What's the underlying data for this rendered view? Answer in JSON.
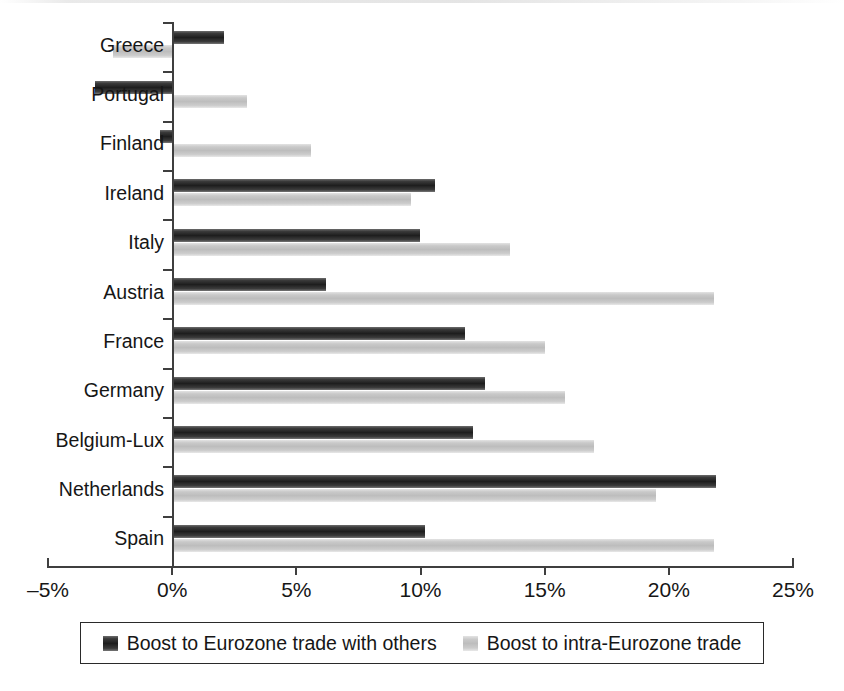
{
  "chart_data": {
    "type": "bar",
    "orientation": "horizontal",
    "title": "",
    "subtitle": "",
    "xlabel": "",
    "ylabel": "",
    "xlim": [
      -5,
      25
    ],
    "xtick_values": [
      -5,
      0,
      5,
      10,
      15,
      20,
      25
    ],
    "xtick_labels": [
      "–5%",
      "0%",
      "5%",
      "10%",
      "15%",
      "20%",
      "25%"
    ],
    "grid": false,
    "legend_position": "bottom",
    "categories": [
      "Greece",
      "Portugal",
      "Finland",
      "Ireland",
      "Italy",
      "Austria",
      "France",
      "Germany",
      "Belgium-Lux",
      "Netherlands",
      "Spain"
    ],
    "series": [
      {
        "name": "Boost to Eurozone trade with others",
        "color": "#1e1e1e",
        "values": [
          2.1,
          -3.1,
          -0.5,
          10.6,
          10.0,
          6.2,
          11.8,
          12.6,
          12.1,
          21.9,
          10.2
        ]
      },
      {
        "name": "Boost to intra-Eurozone trade",
        "color": "#c2c2c2",
        "values": [
          -2.4,
          3.0,
          5.6,
          9.6,
          13.6,
          21.8,
          15.0,
          15.8,
          17.0,
          19.5,
          21.8
        ]
      }
    ]
  },
  "legend": {
    "entries": [
      {
        "label": "Boost to Eurozone trade with others",
        "swatch": "dark-swatch-icon"
      },
      {
        "label": "Boost to intra-Eurozone trade",
        "swatch": "light-swatch-icon"
      }
    ]
  },
  "colors": {
    "series_dark": "#1e1e1e",
    "series_light": "#c2c2c2",
    "axis": "#3f3f3f",
    "text": "#161616",
    "background": "#ffffff"
  }
}
